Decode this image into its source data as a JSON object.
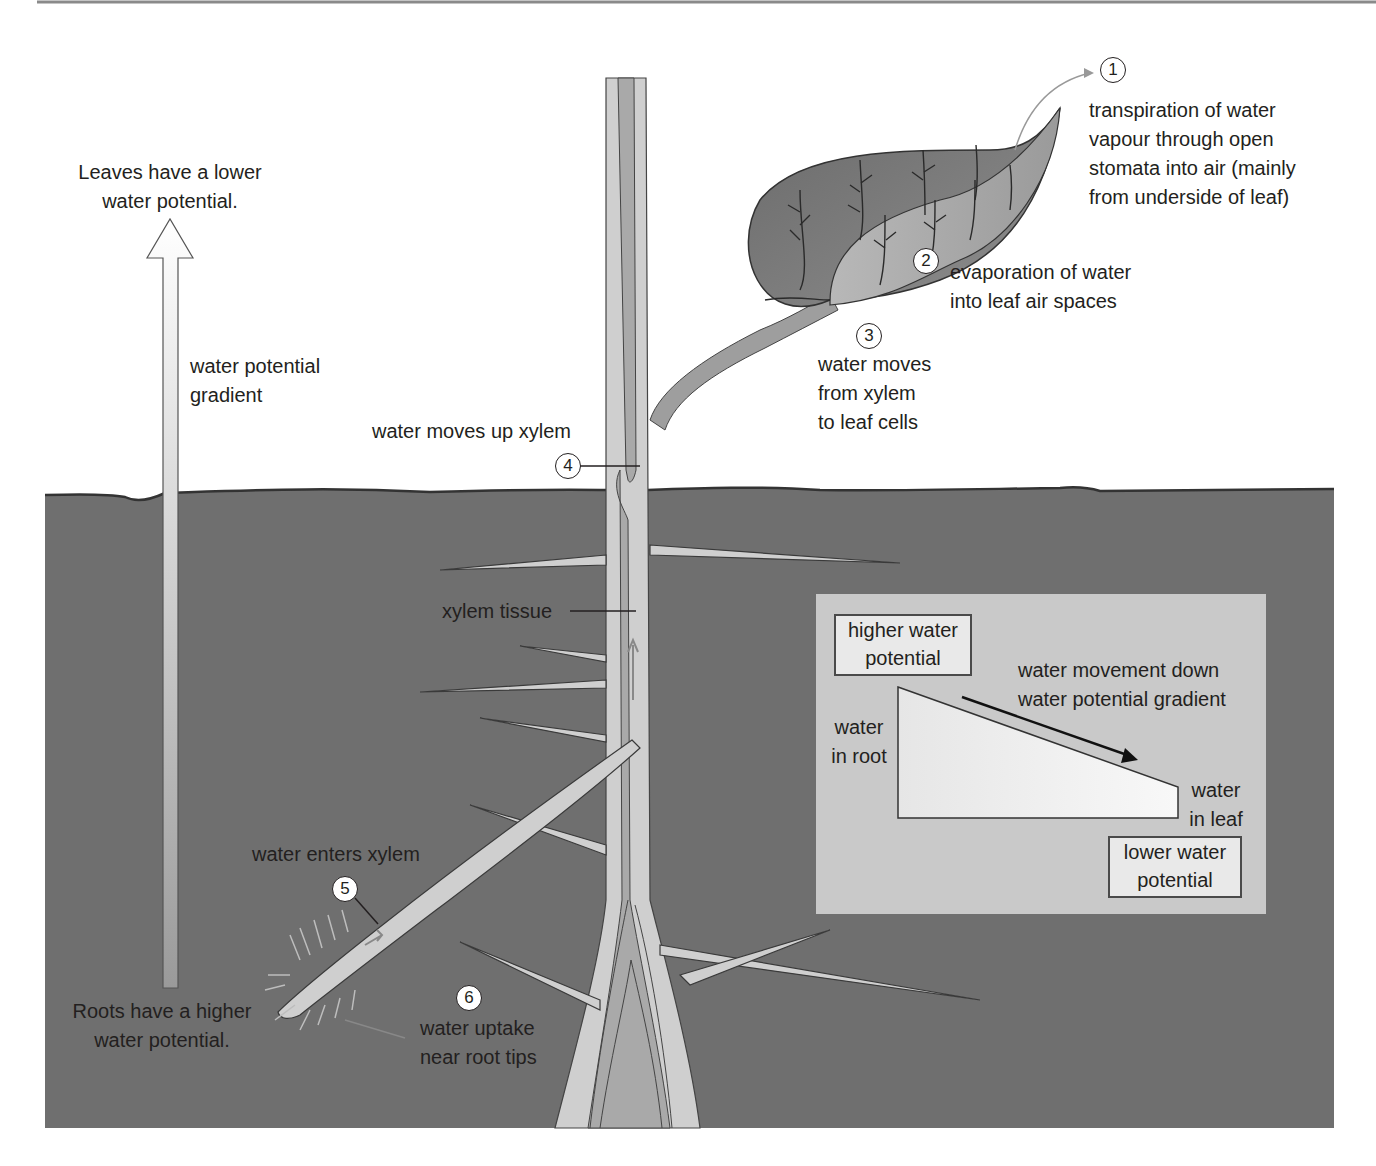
{
  "colors": {
    "soil": "#6f6f6f",
    "soil_edge": "#3a3a3a",
    "plant_light": "#cfcfcf",
    "plant_xylem": "#a9a9a9",
    "leaf_dark": "#7a7a7a",
    "leaf_light": "#a8a8a8",
    "inset_bg": "#c9c9c9",
    "text": "#231f20"
  },
  "gradient_arrow": {
    "top_label": "Leaves have a lower water potential.",
    "top_label_lines": [
      "Leaves have a lower",
      "water potential."
    ],
    "side_label_lines": [
      "water potential",
      "gradient"
    ],
    "bottom_label_lines": [
      "Roots have a higher",
      "water potential."
    ]
  },
  "steps": [
    {
      "number": "1",
      "lines": [
        "transpiration of water",
        "vapour through open",
        "stomata into air (mainly",
        "from underside of leaf)"
      ]
    },
    {
      "number": "2",
      "lines": [
        "evaporation of water",
        "into leaf air spaces"
      ]
    },
    {
      "number": "3",
      "lines": [
        "water moves",
        "from xylem",
        "to leaf cells"
      ]
    },
    {
      "number": "4",
      "lines": [
        "water moves up xylem"
      ]
    },
    {
      "number": "5",
      "lines": [
        "water enters xylem"
      ]
    },
    {
      "number": "6",
      "lines": [
        "water uptake",
        "near root tips"
      ]
    }
  ],
  "xylem_label": "xylem tissue",
  "inset": {
    "higher_box_lines": [
      "higher water",
      "potential"
    ],
    "lower_box_lines": [
      "lower water",
      "potential"
    ],
    "root_label_lines": [
      "water",
      "in root"
    ],
    "leaf_label_lines": [
      "water",
      "in leaf"
    ],
    "movement_label_lines": [
      "water movement down",
      "water potential gradient"
    ]
  }
}
